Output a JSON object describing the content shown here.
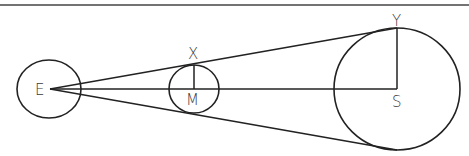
{
  "diagram": {
    "type": "geometry",
    "stroke_color": "#222222",
    "labels": {
      "earth": "E",
      "moon": "M",
      "moon_top": "X",
      "sun": "S",
      "sun_top": "Y"
    },
    "bodies": [
      {
        "name": "earth",
        "label": "E",
        "cx": 49,
        "cy": 89,
        "rx": 32,
        "ry": 29
      },
      {
        "name": "moon",
        "label": "M",
        "cx": 194,
        "cy": 89,
        "rx": 25,
        "ry": 24
      },
      {
        "name": "sun",
        "label": "S",
        "cx": 397,
        "cy": 89,
        "rx": 63,
        "ry": 61
      }
    ],
    "segments": [
      {
        "name": "E-S center line",
        "from": [
          50,
          89
        ],
        "to": [
          397,
          89
        ]
      },
      {
        "name": "upper tangent E-Y",
        "from": [
          50,
          89
        ],
        "to": [
          397,
          28
        ]
      },
      {
        "name": "lower tangent",
        "from": [
          50,
          89
        ],
        "to": [
          397,
          150
        ]
      },
      {
        "name": "MX radius",
        "from": [
          194,
          65
        ],
        "to": [
          194,
          89
        ]
      },
      {
        "name": "SY radius",
        "from": [
          397,
          28
        ],
        "to": [
          397,
          89
        ]
      }
    ]
  }
}
